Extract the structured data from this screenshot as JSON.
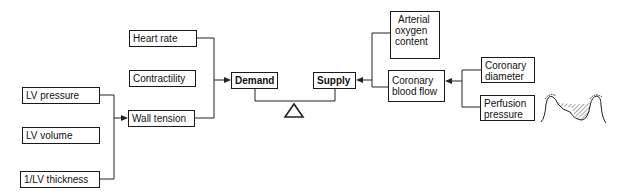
{
  "diagram": {
    "nodes": {
      "lv_pressure": "LV pressure",
      "lv_volume": "LV volume",
      "lv_thickness": "1/LV thickness",
      "wall_tension": "Wall tension",
      "heart_rate": "Heart rate",
      "contractility": "Contractility",
      "demand": "Demand",
      "supply": "Supply",
      "arterial_oxygen": [
        "Arterial",
        "oxygen",
        "content"
      ],
      "coronary_blood_flow": [
        "Coronary",
        "blood flow"
      ],
      "coronary_diameter": [
        "Coronary",
        "diameter"
      ],
      "perfusion_pressure": [
        "Perfusion",
        "pressure"
      ]
    },
    "edges": [
      {
        "from": [
          "lv_pressure",
          "lv_thickness"
        ],
        "to": "wall_tension"
      },
      {
        "from": [
          "heart_rate",
          "wall_tension"
        ],
        "to": "demand"
      },
      {
        "from": [
          "arterial_oxygen",
          "coronary_blood_flow"
        ],
        "to": "supply"
      },
      {
        "from": [
          "coronary_diameter",
          "perfusion_pressure"
        ],
        "to": "coronary_blood_flow"
      }
    ],
    "balance": {
      "left": "demand",
      "right": "supply",
      "fulcrum": "triangle"
    },
    "icons": {
      "pressure_waveform": "aortic-pressure-waveform-icon"
    }
  }
}
